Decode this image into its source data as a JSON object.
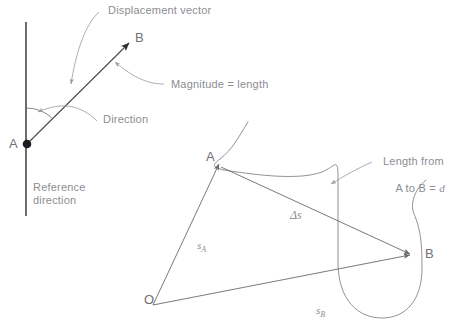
{
  "figure": {
    "background_color": "#ffffff",
    "line_color": "#7a7a80",
    "dark_line_color": "#3a3a3e",
    "text_color": "#8d8d92",
    "point_label_color": "#6f6f75"
  },
  "top_diagram": {
    "reference_line_label_line1": "Reference",
    "reference_line_label_line2": "direction",
    "point_a_label": "A",
    "point_b_label": "B",
    "annotation_displacement": "Displacement vector",
    "annotation_magnitude": "Magnitude = length",
    "annotation_direction": "Direction"
  },
  "bottom_diagram": {
    "origin_label": "O",
    "point_a_label": "A",
    "point_b_label": "B",
    "vector_sa_base": "s",
    "vector_sa_sub": "A",
    "vector_sb_base": "s",
    "vector_sb_sub": "B",
    "vector_delta_s": "Δs",
    "annotation_length_line1": "Length from",
    "annotation_length_line2_prefix": "A to B = ",
    "annotation_length_symbol": "d"
  }
}
